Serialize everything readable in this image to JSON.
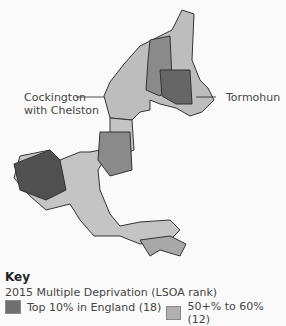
{
  "map": {
    "labels": [
      {
        "text_line1": "Cockington",
        "text_line2": "with Chelston"
      },
      {
        "text_line1": "Tormohun"
      }
    ]
  },
  "key": {
    "title": "Key",
    "subtitle": "2015 Multiple Deprivation (LSOA rank)",
    "items": [
      {
        "label": "Top 10% in England (18)",
        "color": "#6e6e6e"
      },
      {
        "label": "50+% to 60% (12)",
        "color": "#b0b0b0"
      }
    ]
  }
}
